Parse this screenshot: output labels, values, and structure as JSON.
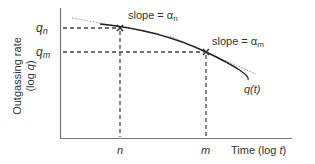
{
  "diagram": {
    "y_axis_label_line1": "Outgassing rate",
    "y_axis_label_line2": "(log q)",
    "x_axis_label": "Time (log t)",
    "curve_label": "q(t)",
    "points": [
      {
        "x_label": "n",
        "y_label": "q_n",
        "slope_label": "slope = α_n"
      },
      {
        "x_label": "m",
        "y_label": "q_m",
        "slope_label": "slope = α_m"
      }
    ],
    "marker_symbol": "×"
  },
  "colors": {
    "axis": "#777777",
    "curve": "#222222",
    "tangent": "#999999",
    "guide": "#444444",
    "text": "#333333"
  }
}
